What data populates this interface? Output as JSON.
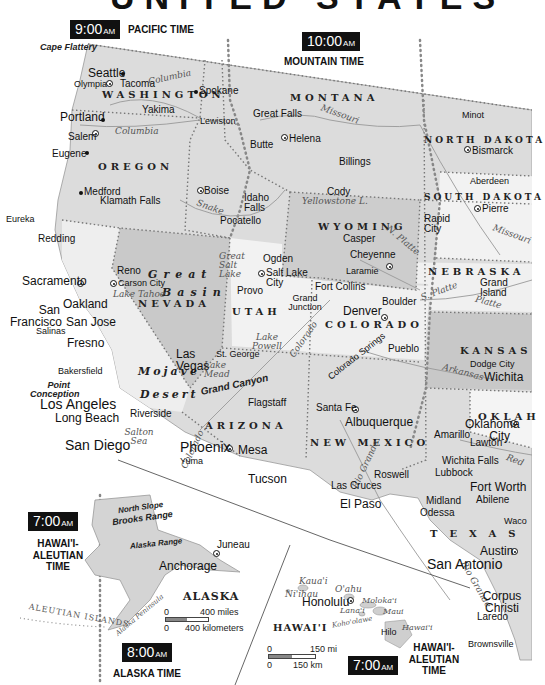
{
  "title_fragment": "UNITED STATES",
  "time_zones": [
    {
      "id": "pacific",
      "time": "9:00",
      "ampm": "AM",
      "name": "PACIFIC TIME"
    },
    {
      "id": "mountain",
      "time": "10:00",
      "ampm": "AM",
      "name": "MOUNTAIN TIME"
    },
    {
      "id": "hawaii-aleutian-left",
      "time": "7:00",
      "ampm": "AM",
      "name": "HAWAI'I-\nALEUTIAN\nTIME"
    },
    {
      "id": "alaska",
      "time": "8:00",
      "ampm": "AM",
      "name": "ALASKA TIME"
    },
    {
      "id": "hawaii-aleutian-right",
      "time": "7:00",
      "ampm": "AM",
      "name": "HAWAI'I-\nALEUTIAN\nTIME"
    }
  ],
  "states": {
    "washington": "WASHINGTON",
    "oregon": "OREGON",
    "idaho": "IDAHO",
    "montana": "MONTANA",
    "north_dakota": "NORTH DAKOTA",
    "south_dakota": "SOUTH DAKOTA",
    "wyoming": "WYOMING",
    "nebraska": "NEBRASKA",
    "nevada": "NEVADA",
    "utah": "UTAH",
    "colorado": "COLORADO",
    "kansas": "KANSAS",
    "california": "CALIFORNIA",
    "arizona": "ARIZONA",
    "new_mexico": "NEW MEXICO",
    "oklahoma": "OKLAH",
    "texas": "TEXAS",
    "alaska": "ALASKA",
    "hawaii": "HAWAI'I"
  },
  "regions": {
    "rocky_mountains": "ROCKY MOUNTAINS",
    "great_plains": "GREAT PLAINS",
    "great_basin_1": "Great",
    "great_basin_2": "Basin",
    "mojave_1": "Mojave",
    "mojave_2": "Desert",
    "sierra_nevada": "Sierra Nevada",
    "cascade_range": "Cascade Range",
    "coast_ranges": "Coast Ranges",
    "grand_canyon": "Grand Canyon",
    "cape_flattery": "Cape Flattery",
    "point_conception": "Point Conception",
    "north_slope": "North Slope",
    "brooks_range": "Brooks Range",
    "alaska_range": "Alaska Range",
    "aleutian_islands": "ALEUTIAN ISLANDS",
    "alaska_peninsula": "Alaska Peninsula"
  },
  "water": {
    "columbia_1": "Columbia",
    "columbia_2": "Columbia",
    "snake": "Snake",
    "missouri_1": "Missouri",
    "missouri_2": "Missouri",
    "yellowstone_l": "Yellowstone L.",
    "great_salt_lake": "Great Salt Lake",
    "lake_tahoe": "Lake Tahoe",
    "lake_powell": "Lake Powell",
    "lake_mead": "Lake Mead",
    "colorado_1": "Colorado",
    "colorado_2": "Colorado",
    "colorado_3": "Colorado",
    "n_platte": "N. Platte",
    "s_platte": "S. Platte",
    "platte": "Platte",
    "arkansas": "Arkansas",
    "salton_sea": "Salton Sea",
    "rio_grande_1": "Rio Grande",
    "rio_grande_2": "Rio Grande",
    "red": "Red",
    "yukon": "Yukon"
  },
  "cities": [
    {
      "name": "Seattle",
      "size": "med"
    },
    {
      "name": "Olympia",
      "size": "sm",
      "capital": true
    },
    {
      "name": "Tacoma",
      "size": "sm"
    },
    {
      "name": "Spokane",
      "size": "sm"
    },
    {
      "name": "Yakima",
      "size": "sm"
    },
    {
      "name": "Portland",
      "size": "med"
    },
    {
      "name": "Salem",
      "size": "sm",
      "capital": true
    },
    {
      "name": "Eugene",
      "size": "sm"
    },
    {
      "name": "Medford",
      "size": "sm"
    },
    {
      "name": "Klamath Falls",
      "size": "sm"
    },
    {
      "name": "Eureka",
      "size": "sm"
    },
    {
      "name": "Redding",
      "size": "sm"
    },
    {
      "name": "Lewiston",
      "size": "sm"
    },
    {
      "name": "Great Falls",
      "size": "sm"
    },
    {
      "name": "Helena",
      "size": "sm",
      "capital": true
    },
    {
      "name": "Butte",
      "size": "sm"
    },
    {
      "name": "Billings",
      "size": "sm"
    },
    {
      "name": "Minot",
      "size": "sm"
    },
    {
      "name": "Bismarck",
      "size": "sm",
      "capital": true
    },
    {
      "name": "Aberdeen",
      "size": "sm"
    },
    {
      "name": "Pierre",
      "size": "sm",
      "capital": true
    },
    {
      "name": "Rapid City",
      "size": "sm"
    },
    {
      "name": "Boise",
      "size": "sm",
      "capital": true
    },
    {
      "name": "Idaho Falls",
      "size": "sm"
    },
    {
      "name": "Pocatello",
      "size": "sm"
    },
    {
      "name": "Cody",
      "size": "sm"
    },
    {
      "name": "Casper",
      "size": "sm"
    },
    {
      "name": "Cheyenne",
      "size": "sm",
      "capital": true
    },
    {
      "name": "Laramie",
      "size": "sm"
    },
    {
      "name": "Grand Island",
      "size": "sm"
    },
    {
      "name": "Sacramento",
      "size": "med",
      "capital": true
    },
    {
      "name": "Reno",
      "size": "sm"
    },
    {
      "name": "Carson City",
      "size": "sm",
      "capital": true
    },
    {
      "name": "Ogden",
      "size": "sm"
    },
    {
      "name": "Salt Lake City",
      "size": "sm",
      "capital": true
    },
    {
      "name": "Provo",
      "size": "sm"
    },
    {
      "name": "San Francisco",
      "size": "med"
    },
    {
      "name": "Oakland",
      "size": "med"
    },
    {
      "name": "San Jose",
      "size": "med"
    },
    {
      "name": "Salinas",
      "size": "sm"
    },
    {
      "name": "Fresno",
      "size": "med"
    },
    {
      "name": "Bakersfield",
      "size": "sm"
    },
    {
      "name": "Fort Collins",
      "size": "sm"
    },
    {
      "name": "Boulder",
      "size": "sm"
    },
    {
      "name": "Denver",
      "size": "med",
      "capital": true
    },
    {
      "name": "Grand Junction",
      "size": "sm"
    },
    {
      "name": "Colorado Springs",
      "size": "sm"
    },
    {
      "name": "Pueblo",
      "size": "sm"
    },
    {
      "name": "Dodge City",
      "size": "sm"
    },
    {
      "name": "Wichita",
      "size": "med"
    },
    {
      "name": "Las Vegas",
      "size": "med"
    },
    {
      "name": "St. George",
      "size": "sm"
    },
    {
      "name": "Los Angeles",
      "size": "big"
    },
    {
      "name": "Long Beach",
      "size": "med"
    },
    {
      "name": "Riverside",
      "size": "sm"
    },
    {
      "name": "San Diego",
      "size": "big"
    },
    {
      "name": "Flagstaff",
      "size": "sm"
    },
    {
      "name": "Phoenix",
      "size": "big",
      "capital": true
    },
    {
      "name": "Mesa",
      "size": "med"
    },
    {
      "name": "Yuma",
      "size": "sm"
    },
    {
      "name": "Tucson",
      "size": "med"
    },
    {
      "name": "Santa Fe",
      "size": "sm",
      "capital": true
    },
    {
      "name": "Albuquerque",
      "size": "med"
    },
    {
      "name": "Roswell",
      "size": "sm"
    },
    {
      "name": "Las Cruces",
      "size": "sm"
    },
    {
      "name": "El Paso",
      "size": "med"
    },
    {
      "name": "Amarillo",
      "size": "sm"
    },
    {
      "name": "Oklahoma City",
      "size": "med",
      "capital": true
    },
    {
      "name": "Lawton",
      "size": "sm"
    },
    {
      "name": "Wichita Falls",
      "size": "sm"
    },
    {
      "name": "Lubbock",
      "size": "sm"
    },
    {
      "name": "Fort Worth",
      "size": "med"
    },
    {
      "name": "Abilene",
      "size": "sm"
    },
    {
      "name": "Midland",
      "size": "sm"
    },
    {
      "name": "Odessa",
      "size": "sm"
    },
    {
      "name": "Waco",
      "size": "sm"
    },
    {
      "name": "Austin",
      "size": "med",
      "capital": true
    },
    {
      "name": "San Antonio",
      "size": "big"
    },
    {
      "name": "Corpus Christi",
      "size": "med"
    },
    {
      "name": "Laredo",
      "size": "sm"
    },
    {
      "name": "Brownsville",
      "size": "sm"
    },
    {
      "name": "Juneau",
      "size": "sm",
      "capital": true
    },
    {
      "name": "Anchorage",
      "size": "med"
    },
    {
      "name": "Honolulu",
      "size": "med",
      "capital": true
    },
    {
      "name": "Hilo",
      "size": "sm"
    }
  ],
  "hawaii_islands": {
    "kauai": "Kaua'i",
    "niihau": "Ni'ihau",
    "oahu": "O'ahu",
    "molokai": "Moloka'i",
    "lanai": "Lana'i",
    "maui": "Maui",
    "kahoolawe": "Koho'olawe",
    "hawaii": "Hawai'i"
  },
  "scales": {
    "alaska": {
      "miles_zero": "0",
      "miles": "400 miles",
      "km_zero": "0",
      "km": "400 kilometers"
    },
    "hawaii": {
      "mi_zero": "0",
      "mi": "150 mi",
      "km_zero": "0",
      "km": "150 km"
    }
  },
  "colors": {
    "land": "#d9d9d9",
    "land_light": "#ececec",
    "land_dark": "#c4c4c4",
    "border": "#777777",
    "river": "#8a8a8a",
    "tz_box": "#111111"
  }
}
